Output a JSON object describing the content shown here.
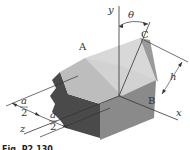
{
  "figure": {
    "caption": "Fig. P2.130",
    "labels": {
      "y_axis": "y",
      "x_axis": "x",
      "z_axis": "z",
      "angle": "θ",
      "point_A": "A",
      "point_B": "B",
      "point_C": "C",
      "height": "h",
      "dim_a": "a",
      "dim_2": "2"
    },
    "colors": {
      "top_face": "#bdbdbd",
      "front_face": "#8c8c8c",
      "side_face": "#6e6e6e",
      "broken_face": "#4a4a4a",
      "triangle_face": "#d6d6d6",
      "lines": "#333333"
    }
  }
}
